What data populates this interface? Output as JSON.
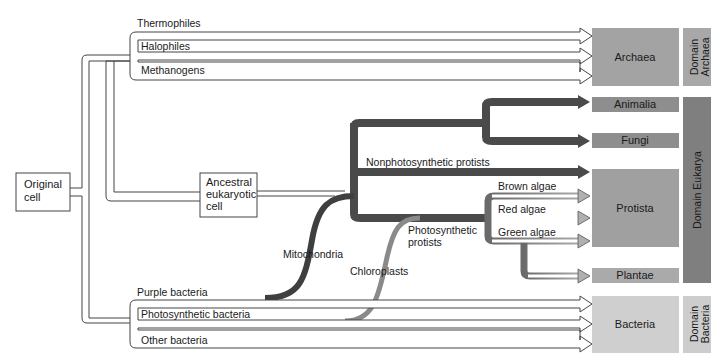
{
  "diagram": {
    "origin": {
      "label_lines": [
        "Original",
        "cell"
      ]
    },
    "ancestral_eukaryote": {
      "label_lines": [
        "Ancestral",
        "eukaryotic",
        "cell"
      ]
    },
    "archaea_branches": [
      "Thermophiles",
      "Halophiles",
      "Methanogens"
    ],
    "bacteria_branches": [
      "Purple bacteria",
      "Photosynthetic bacteria",
      "Other bacteria"
    ],
    "eukarya_branches": {
      "nonphotosynthetic": "Nonphotosynthetic protists",
      "photosynthetic_lines": [
        "Photosynthetic",
        "protists"
      ],
      "algae": [
        "Brown algae",
        "Red algae",
        "Green algae"
      ]
    },
    "endosymbiosis": {
      "mitochondria": "Mitochondria",
      "chloroplasts": "Chloroplasts"
    },
    "kingdoms": {
      "archaea": "Archaea",
      "animalia": "Animalia",
      "fungi": "Fungi",
      "protista": "Protista",
      "plantae": "Plantae",
      "bacteria": "Bacteria"
    },
    "domains": {
      "archaea_lines": [
        "Domain",
        "Archaea"
      ],
      "eukarya": "Domain Eukarya",
      "bacteria_lines": [
        "Domain",
        "Bacteria"
      ]
    },
    "colors": {
      "archaea_box": "#a3a3a3",
      "animalia_box": "#8e8e8e",
      "fungi_box": "#8e8e8e",
      "protista_box": "#a0a0a0",
      "plantae_box": "#aaaaaa",
      "bacteria_box": "#cfcfcf",
      "domain_eukarya": "#7f7f7f",
      "domain_archaea": "#a8a8a8",
      "domain_bacteria": "#cdcdcd",
      "dark_arrow": "#505050",
      "mid_arrow": "#8c8c8c",
      "mito_strand": "#3f3f3f",
      "chloro_strand": "#8a8a8a"
    }
  }
}
